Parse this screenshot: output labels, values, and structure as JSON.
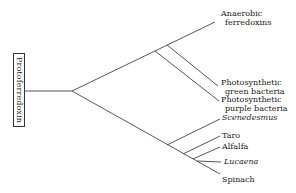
{
  "root": {
    "label": "Protoferredoxin"
  },
  "leaves": [
    {
      "id": "anaerobic",
      "line1": "Anaerobic",
      "line2": "ferredoxins",
      "italic": false
    },
    {
      "id": "green",
      "line1": "Photosynthetic",
      "line2": "green bacteria",
      "italic": false
    },
    {
      "id": "purple",
      "line1": "Photosynthetic",
      "line2": "purple bacteria",
      "italic": false
    },
    {
      "id": "scenedesmus",
      "line1": "Scenedesmus",
      "italic": true
    },
    {
      "id": "taro",
      "line1": "Taro",
      "italic": false
    },
    {
      "id": "alfalfa",
      "line1": "Alfalfa",
      "italic": false
    },
    {
      "id": "lucaena",
      "line1": "Lucaena",
      "italic": true
    },
    {
      "id": "spinach",
      "line1": "Spinach",
      "italic": false
    }
  ],
  "colors": {
    "line": "#444444",
    "text": "#1a1a1a",
    "background": "#ffffff"
  }
}
